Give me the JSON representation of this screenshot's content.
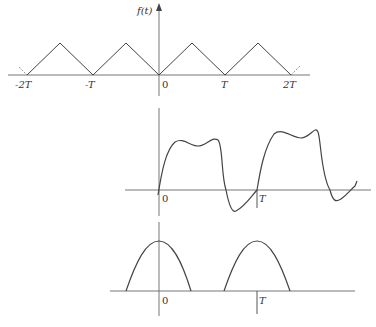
{
  "figure": {
    "top_plot": {
      "ylabel": "f(t)",
      "ticks": [
        "-2T",
        "-T",
        "0",
        "T",
        "2T"
      ],
      "description": "Periodic triangular wave with period T"
    },
    "middle_plot": {
      "ticks": [
        "0",
        "T"
      ],
      "description": "Periodic distorted square-like wave with ripple and undershoot"
    },
    "bottom_plot": {
      "ticks": [
        "0",
        "T"
      ],
      "description": "Periodic half-sine pulses centered at 0 and T"
    }
  },
  "colors": {
    "line": "#444444",
    "axis": "#777777"
  }
}
